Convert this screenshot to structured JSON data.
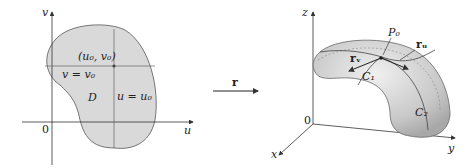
{
  "left_panel": {
    "axis_v": "v",
    "axis_u": "u",
    "origin": "0",
    "point_label": "(u₀, v₀)",
    "line_v": "v = v₀",
    "line_u": "u = u₀",
    "region": "D"
  },
  "mapping": {
    "label": "r"
  },
  "right_panel": {
    "axis_z": "z",
    "axis_y": "y",
    "axis_x": "x",
    "origin": "0",
    "point": "P₀",
    "vec_u": "rᵤ",
    "vec_v": "rᵥ",
    "curve1": "C₁",
    "curve2": "C₂"
  },
  "colors": {
    "fill": "#d9d9d9",
    "stroke": "#555555",
    "axis": "#333333"
  }
}
